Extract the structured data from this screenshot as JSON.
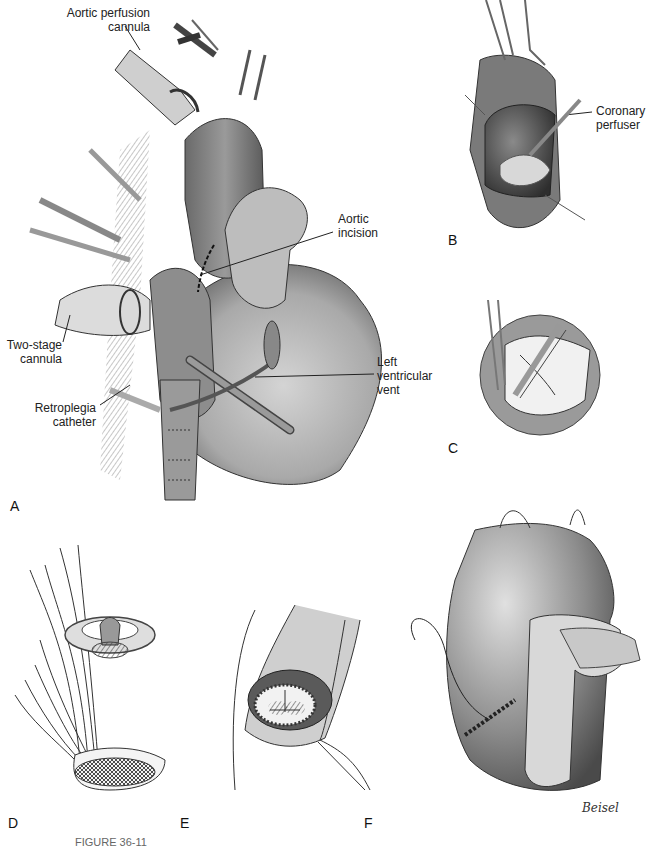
{
  "figure": {
    "panels": [
      {
        "letter": "A",
        "description": "Heart with cannulation for aortic valve replacement"
      },
      {
        "letter": "B",
        "description": "Opened aorta with coronary perfuser"
      },
      {
        "letter": "C",
        "description": "Excision of diseased aortic valve leaflets"
      },
      {
        "letter": "D",
        "description": "Prosthetic valve lowered on sutures into annulus"
      },
      {
        "letter": "E",
        "description": "Prosthetic valve seated in annulus"
      },
      {
        "letter": "F",
        "description": "Closure of aortotomy"
      }
    ],
    "annotations": {
      "aortic_perfusion_cannula_line1": "Aortic perfusion",
      "aortic_perfusion_cannula_line2": "cannula",
      "aortic_incision_line1": "Aortic",
      "aortic_incision_line2": "incision",
      "two_stage_cannula_line1": "Two-stage",
      "two_stage_cannula_line2": "cannula",
      "retroplegia_catheter_line1": "Retroplegia",
      "retroplegia_catheter_line2": "catheter",
      "lv_vent_line1": "Left",
      "lv_vent_line2": "ventricular",
      "lv_vent_line3": "vent",
      "coronary_perfuser_line1": "Coronary",
      "coronary_perfuser_line2": "perfuser"
    },
    "signature": "Beisel",
    "caption_partial": "FIGURE 36-11"
  }
}
